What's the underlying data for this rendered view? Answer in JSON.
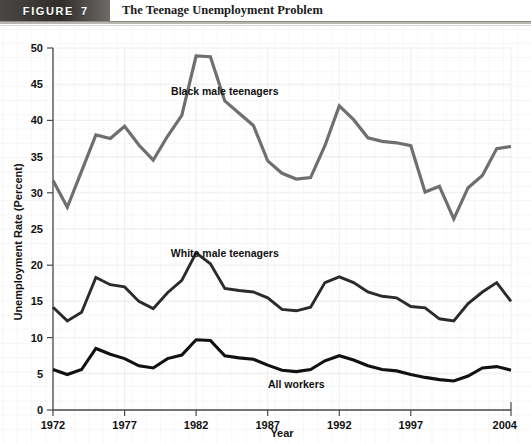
{
  "header": {
    "tab_label": "FIGURE",
    "tab_number": "7",
    "title": "The Teenage Unemployment Problem"
  },
  "chart_data": {
    "type": "line",
    "title": "The Teenage Unemployment Problem",
    "xlabel": "Year",
    "ylabel": "Unemployment Rate (Percent)",
    "xlim": [
      1972,
      2004
    ],
    "ylim": [
      0,
      50
    ],
    "grid": true,
    "legend_position": "inline-annotations",
    "xticks": [
      1972,
      1977,
      1982,
      1987,
      1992,
      1997,
      2004
    ],
    "xtick_labels": [
      "1972",
      "1977",
      "1982",
      "1987",
      "1992",
      "1997",
      "2004"
    ],
    "yticks": [
      0,
      5,
      10,
      15,
      20,
      25,
      30,
      35,
      40,
      45,
      50
    ],
    "ytick_labels": [
      "0",
      "5",
      "10",
      "15",
      "20",
      "25",
      "30",
      "35",
      "40",
      "45",
      "50"
    ],
    "x": [
      1972,
      1973,
      1974,
      1975,
      1976,
      1977,
      1978,
      1979,
      1980,
      1981,
      1982,
      1983,
      1984,
      1985,
      1986,
      1987,
      1988,
      1989,
      1990,
      1991,
      1992,
      1993,
      1994,
      1995,
      1996,
      1997,
      1998,
      1999,
      2000,
      2001,
      2002,
      2003,
      2004
    ],
    "series": [
      {
        "name": "Black male teenagers",
        "color": "#6f6f6f",
        "label_x": 1984,
        "label_y": 43.5,
        "values": [
          31.7,
          28.0,
          33.0,
          38.0,
          37.5,
          39.2,
          36.6,
          34.5,
          37.8,
          40.7,
          48.9,
          48.8,
          42.7,
          41.0,
          39.3,
          34.4,
          32.7,
          31.9,
          32.1,
          36.5,
          42.0,
          40.1,
          37.6,
          37.1,
          36.9,
          36.5,
          30.1,
          30.9,
          26.4,
          30.7,
          32.4,
          36.1,
          36.4
        ]
      },
      {
        "name": "White male teenagers",
        "color": "#2b2b2b",
        "label_x": 1984,
        "label_y": 21.2,
        "values": [
          14.2,
          12.3,
          13.5,
          18.3,
          17.3,
          17.0,
          15.0,
          14.0,
          16.2,
          17.9,
          21.7,
          20.2,
          16.8,
          16.5,
          16.3,
          15.5,
          13.9,
          13.7,
          14.2,
          17.6,
          18.4,
          17.6,
          16.3,
          15.7,
          15.5,
          14.3,
          14.1,
          12.6,
          12.3,
          14.7,
          16.3,
          17.6,
          15.0
        ]
      },
      {
        "name": "All workers",
        "color": "#111111",
        "label_x": 1989,
        "label_y": 3.1,
        "values": [
          5.6,
          4.9,
          5.6,
          8.5,
          7.7,
          7.1,
          6.1,
          5.8,
          7.1,
          7.6,
          9.7,
          9.6,
          7.5,
          7.2,
          7.0,
          6.2,
          5.5,
          5.3,
          5.6,
          6.8,
          7.5,
          6.9,
          6.1,
          5.6,
          5.4,
          4.9,
          4.5,
          4.2,
          4.0,
          4.7,
          5.8,
          6.0,
          5.5
        ]
      }
    ]
  }
}
